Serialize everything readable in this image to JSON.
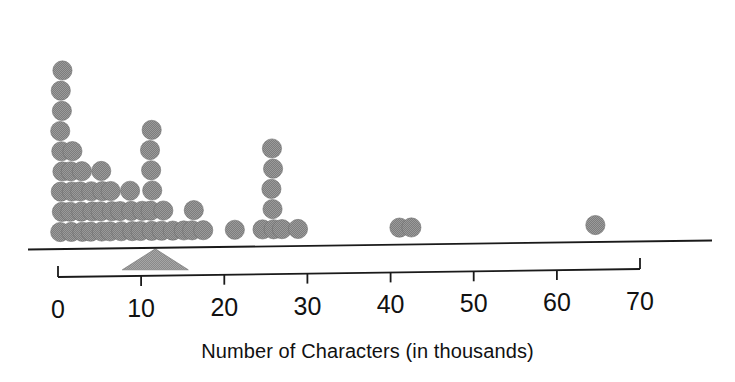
{
  "figure": {
    "caption": "Number of Characters (in thousands)",
    "dot_color": "#808080",
    "axis_color": "#1a1a1a",
    "background": "#ffffff"
  },
  "chart_data": {
    "type": "dotplot",
    "title": "",
    "xlabel": "Number of Characters (in thousands)",
    "ylabel": "",
    "xlim": [
      0,
      70
    ],
    "xticks": [
      0,
      10,
      20,
      30,
      40,
      50,
      60,
      70
    ],
    "xtick_labels": [
      "0",
      "10",
      "20",
      "30",
      "40",
      "50",
      "60",
      "70"
    ],
    "grid": false,
    "legend": null,
    "dot_diameter_units": 1.7,
    "balance_point": {
      "value": 11.7,
      "marker": "triangle-fulcrum",
      "label": ""
    },
    "stacks": [
      {
        "value": 0.4,
        "count": 9
      },
      {
        "value": 1.6,
        "count": 5
      },
      {
        "value": 2.8,
        "count": 4
      },
      {
        "value": 4.0,
        "count": 3
      },
      {
        "value": 5.2,
        "count": 4
      },
      {
        "value": 6.4,
        "count": 3
      },
      {
        "value": 7.6,
        "count": 2
      },
      {
        "value": 8.8,
        "count": 3
      },
      {
        "value": 10.0,
        "count": 2
      },
      {
        "value": 11.2,
        "count": 6
      },
      {
        "value": 12.6,
        "count": 2
      },
      {
        "value": 13.8,
        "count": 1
      },
      {
        "value": 15.0,
        "count": 1
      },
      {
        "value": 16.2,
        "count": 2
      },
      {
        "value": 17.4,
        "count": 1
      },
      {
        "value": 21.4,
        "count": 1
      },
      {
        "value": 24.6,
        "count": 1
      },
      {
        "value": 25.8,
        "count": 5
      },
      {
        "value": 27.0,
        "count": 1
      },
      {
        "value": 28.8,
        "count": 1
      },
      {
        "value": 41.2,
        "count": 1
      },
      {
        "value": 42.5,
        "count": 1
      },
      {
        "value": 64.5,
        "count": 1
      }
    ],
    "values": [
      0.4,
      0.4,
      0.4,
      0.4,
      0.4,
      0.4,
      0.4,
      0.4,
      0.4,
      1.6,
      1.6,
      1.6,
      1.6,
      1.6,
      2.8,
      2.8,
      2.8,
      2.8,
      4.0,
      4.0,
      4.0,
      5.2,
      5.2,
      5.2,
      5.2,
      6.4,
      6.4,
      6.4,
      7.6,
      7.6,
      8.8,
      8.8,
      8.8,
      10.0,
      10.0,
      11.2,
      11.2,
      11.2,
      11.2,
      11.2,
      11.2,
      12.6,
      12.6,
      13.8,
      15.0,
      16.2,
      16.2,
      17.4,
      21.4,
      24.6,
      25.8,
      25.8,
      25.8,
      25.8,
      25.8,
      27.0,
      28.8,
      41.2,
      42.5,
      64.5
    ],
    "n": 61
  }
}
